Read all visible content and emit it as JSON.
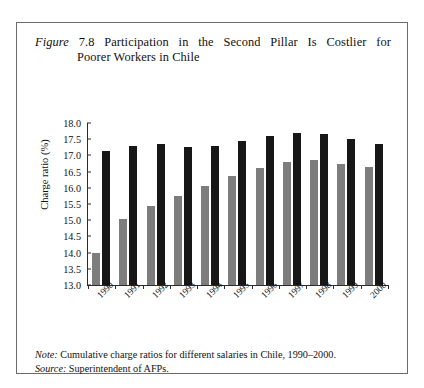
{
  "figure": {
    "label": "Figure",
    "number": "7.8",
    "title_line1": "Participation in the Second Pillar Is Costlier for",
    "title_line2": "Poorer Workers in Chile"
  },
  "notes": {
    "note_label": "Note:",
    "note_text": " Cumulative charge ratios for different salaries in Chile, 1990–2000.",
    "source_label": "Source:",
    "source_text": " Superintendent of AFPs."
  },
  "colors": {
    "series_gray": "#7d7d7d",
    "series_black": "#171717",
    "axis": "#2b2b2b",
    "frame": "#6b6b6b"
  },
  "chart_data": {
    "type": "bar",
    "title": "Figure 7.8 Participation in the Second Pillar Is Costlier for Poorer Workers in Chile",
    "xlabel": "",
    "ylabel": "Charge ratio (%)",
    "ylim": [
      13.0,
      18.0
    ],
    "ytick_step": 0.5,
    "yticks": [
      "18.0",
      "17.5",
      "17.0",
      "16.5",
      "16.0",
      "15.5",
      "15.0",
      "14.5",
      "14.0",
      "13.5",
      "13.0"
    ],
    "grid": false,
    "legend_position": "bottom",
    "categories": [
      "1990",
      "1991",
      "1992",
      "1993",
      "1994",
      "1995",
      "1996",
      "1997",
      "1998",
      "1999",
      "2000"
    ],
    "series": [
      {
        "name": "Cheapest AFP — 900,000 pesos",
        "color": "#7d7d7d",
        "values": [
          14.0,
          15.05,
          15.45,
          15.75,
          16.05,
          16.35,
          16.6,
          16.8,
          16.85,
          16.75,
          16.65
        ]
      },
      {
        "name": "Cheapest AFP — 300,000 pesos",
        "color": "#171717",
        "values": [
          17.15,
          17.3,
          17.35,
          17.25,
          17.3,
          17.45,
          17.6,
          17.68,
          17.65,
          17.5,
          17.35
        ]
      }
    ]
  }
}
